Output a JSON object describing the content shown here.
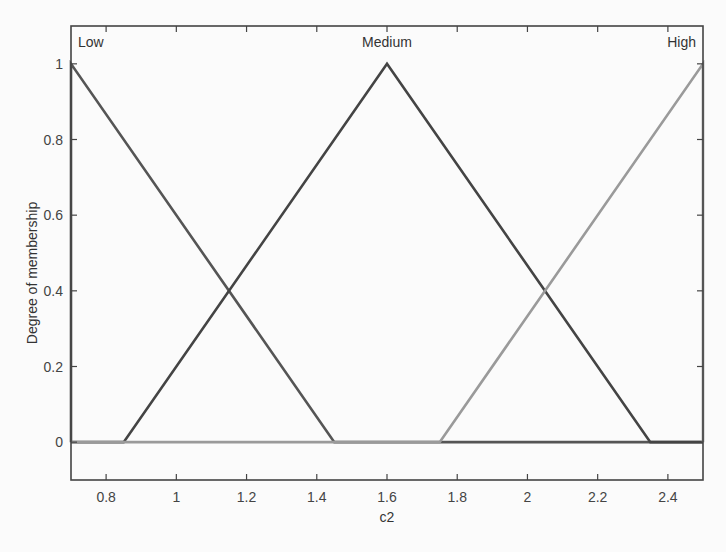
{
  "chart_data": {
    "type": "line",
    "title": "",
    "xlabel": "c2",
    "ylabel": "Degree of membership",
    "xlim": [
      0.7,
      2.5
    ],
    "ylim": [
      -0.1,
      1.1
    ],
    "xticks": [
      0.8,
      1,
      1.2,
      1.4,
      1.6,
      1.8,
      2,
      2.2,
      2.4
    ],
    "xtick_labels": [
      "0.8",
      "1",
      "1.2",
      "1.4",
      "1.6",
      "1.8",
      "2",
      "2.2",
      "2.4"
    ],
    "yticks": [
      0,
      0.2,
      0.4,
      0.6,
      0.8,
      1
    ],
    "ytick_labels": [
      "0",
      "0.2",
      "0.4",
      "0.6",
      "0.8",
      "1"
    ],
    "grid": false,
    "legend": null,
    "series": [
      {
        "name": "Low",
        "shape": "triangular",
        "params": [
          0.7,
          0.7,
          1.45
        ],
        "x": [
          0.7,
          0.7,
          1.45,
          2.5
        ],
        "y": [
          0,
          1,
          0,
          0
        ],
        "color": "#555555",
        "label_pos": [
          0.72,
          1.045
        ]
      },
      {
        "name": "Medium",
        "shape": "triangular",
        "params": [
          0.85,
          1.6,
          2.35
        ],
        "x": [
          0.7,
          0.85,
          1.6,
          2.35,
          2.5
        ],
        "y": [
          0,
          0,
          1,
          0,
          0
        ],
        "color": "#444444",
        "label_pos": [
          1.6,
          1.045
        ]
      },
      {
        "name": "High",
        "shape": "triangular",
        "params": [
          1.75,
          2.5,
          2.5
        ],
        "x": [
          0.7,
          1.75,
          2.5,
          2.5
        ],
        "y": [
          0,
          0,
          1,
          0
        ],
        "color": "#9a9a9a",
        "label_pos": [
          2.48,
          1.045
        ]
      }
    ]
  }
}
